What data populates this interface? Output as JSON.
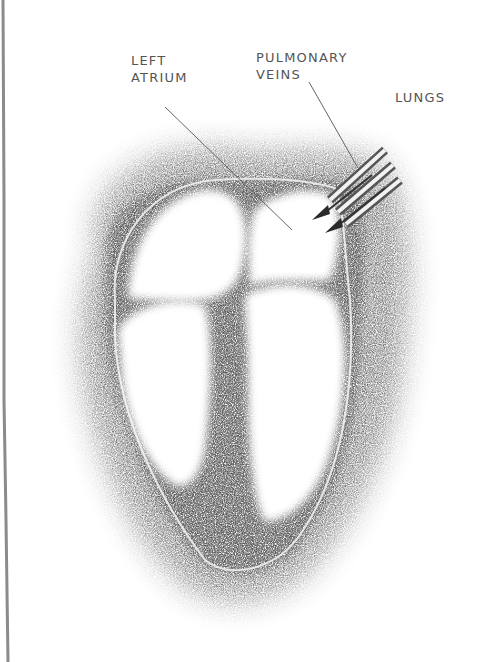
{
  "diagram": {
    "labels": {
      "left_atrium": [
        "LEFT",
        "ATRIUM"
      ],
      "pulmonary_veins": [
        "PULMONARY",
        "VEINS"
      ],
      "lungs": "LUNGS"
    },
    "colors": {
      "background": "#ffffff",
      "shading": "#4a4a4a",
      "label_text": "#555555",
      "leader_line": "#666666"
    }
  }
}
